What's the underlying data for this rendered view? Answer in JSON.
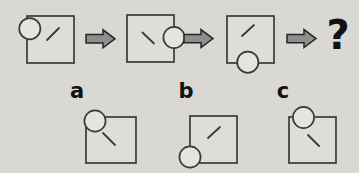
{
  "question_mark": "?",
  "colors": {
    "background": "#d9d8d3",
    "stroke": "#3a3a3c",
    "square_fill": "#deddd8",
    "circle_fill": "#e5e4df",
    "arrow_fill": "#8e8e8e",
    "arrow_stroke": "#262626",
    "text": "#121212"
  },
  "sequence": [
    {
      "name": "step-1",
      "circle_position": "top-left-corner",
      "line_direction": "/"
    },
    {
      "name": "step-2",
      "circle_position": "right-edge-middle",
      "line_direction": "\\"
    },
    {
      "name": "step-3",
      "circle_position": "bottom-edge-center",
      "line_direction": "/"
    }
  ],
  "options": [
    {
      "label": "a",
      "circle_position": "top-left-corner",
      "line_direction": "\\"
    },
    {
      "label": "b",
      "circle_position": "bottom-left-corner",
      "line_direction": "/"
    },
    {
      "label": "c",
      "circle_position": "top-edge-left",
      "line_direction": "\\"
    }
  ]
}
